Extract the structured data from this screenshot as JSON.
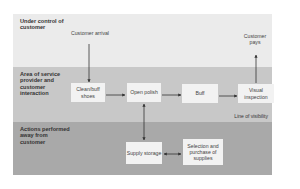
{
  "bands": [
    {
      "label": "Under control of customer",
      "color": "#ebebeb"
    },
    {
      "label": "Area of service provider and customer interaction",
      "color": "#c8c8c8"
    },
    {
      "label": "Actions performed away from customer",
      "color": "#a9a9a9"
    }
  ],
  "line_of_visibility": "Line of visibility",
  "nodes": {
    "customer_arrival": "Customer arrival",
    "customer_pays": "Customer pays",
    "clean_buff_shoes": "Clean/buff shoes",
    "open_polish": "Open polish",
    "buff": "Buff",
    "visual_inspection": "Visual inspection",
    "supply_storage": "Supply storage",
    "selection_purchase": "Selection and purchase of supplies"
  }
}
